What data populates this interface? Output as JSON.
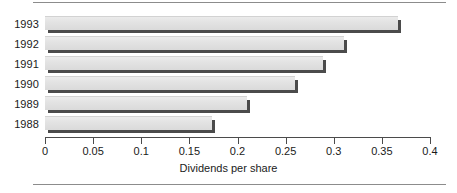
{
  "chart_data": {
    "type": "bar",
    "orientation": "horizontal",
    "title": "",
    "xlabel": "Dividends per share",
    "ylabel": "",
    "categories": [
      "1993",
      "1992",
      "1991",
      "1990",
      "1989",
      "1988"
    ],
    "values": [
      0.367,
      0.311,
      0.289,
      0.26,
      0.21,
      0.173
    ],
    "xlim": [
      0,
      0.4
    ],
    "xticks": [
      0,
      0.05,
      0.1,
      0.15,
      0.2,
      0.25,
      0.3,
      0.35,
      0.4
    ],
    "xtick_labels": [
      "0",
      "0.05",
      "0.1",
      "0.15",
      "0.2",
      "0.25",
      "0.3",
      "0.35",
      "0.4"
    ],
    "grid": false,
    "legend": null,
    "series": [
      {
        "name": "Dividends per share",
        "values": [
          0.367,
          0.311,
          0.289,
          0.26,
          0.21,
          0.173
        ]
      }
    ]
  },
  "style": {
    "bar_fill": "#e3e3e3",
    "bar_shadow": "#4b4b4b",
    "axis_color": "#4b4b4b",
    "rule_color": "#8c8c8c",
    "text_color": "#1a1a1a",
    "background": "#ffffff"
  },
  "geometry": {
    "plot_left": 45,
    "plot_right": 430,
    "axis_y": 137,
    "first_bar_top": 16,
    "row_pitch": 20,
    "bar_height": 14
  }
}
